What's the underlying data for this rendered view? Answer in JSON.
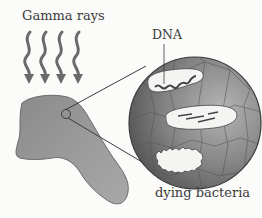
{
  "figure": {
    "labels": {
      "gamma_rays": "Gamma rays",
      "dna": "DNA",
      "dying_bacteria": "dying bacteria"
    },
    "icons": {
      "rays": "wavy-arrow-icon",
      "meat": "meat-piece-icon",
      "magnifier": "magnified-circle-icon",
      "bacterium": "bacterium-icon"
    },
    "ray_count": 4,
    "bacteria_count": 3,
    "colors": {
      "background": "#fbfbfa",
      "ray": "#6a6a6a",
      "meat": "#8d8d8d",
      "circle_fill": "#7a7a7a",
      "bacteria": "#f4f4f2",
      "outline": "#3c3c3c"
    }
  }
}
